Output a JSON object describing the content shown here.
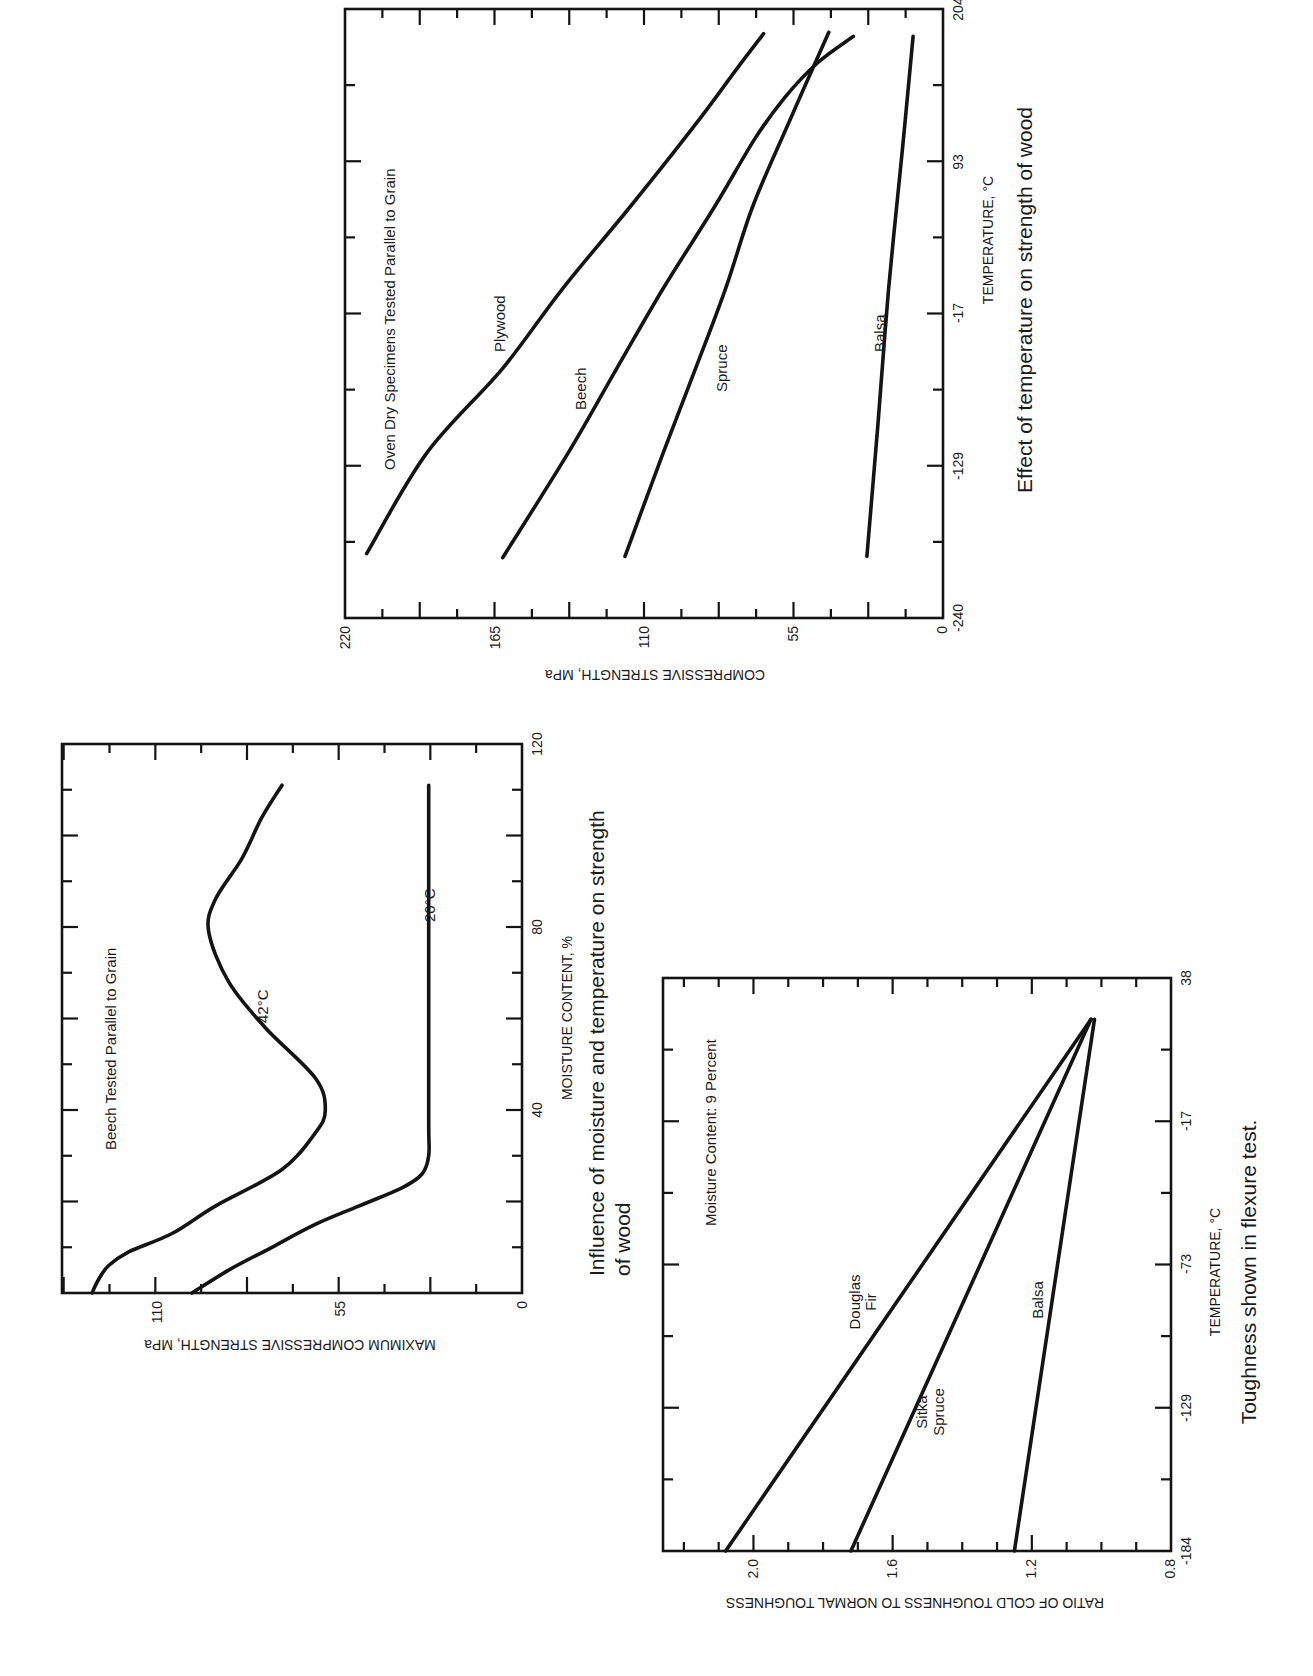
{
  "chart_data": [
    {
      "id": "temp_strength",
      "type": "line",
      "title": "Effect of temperature on strength of wood",
      "annotation": "Oven Dry Specimens Tested Parallel to Grain",
      "xlabel": "TEMPERATURE, °C",
      "ylabel": "COMPRESSIVE STRENGTH, MPa",
      "x_ticks": [
        "-240",
        "-129",
        "-17",
        "93",
        "204"
      ],
      "y_ticks": [
        "0",
        "55",
        "110",
        "165",
        "220"
      ],
      "xlim": [
        -240,
        204
      ],
      "ylim": [
        0,
        220
      ],
      "grid": false,
      "orientation": "rotated 90° counter-clockwise",
      "series": [
        {
          "name": "Plywood",
          "x": [
            -193,
            -120,
            -58,
            0,
            60,
            120,
            160,
            186
          ],
          "y": [
            212,
            190,
            162,
            140,
            115,
            91,
            76,
            66
          ]
        },
        {
          "name": "Beech",
          "x": [
            -196,
            -120,
            -58,
            0,
            60,
            110,
            140,
            165,
            184
          ],
          "y": [
            162,
            138,
            120,
            103,
            84,
            69,
            58,
            46,
            33
          ]
        },
        {
          "name": "Spruce",
          "x": [
            -195,
            -120,
            -58,
            0,
            60,
            120,
            187
          ],
          "y": [
            117,
            103,
            91,
            80,
            70,
            57,
            42
          ]
        },
        {
          "name": "Balsa",
          "x": [
            -195,
            -100,
            0,
            100,
            184
          ],
          "y": [
            28,
            24,
            20,
            15,
            11
          ]
        }
      ]
    },
    {
      "id": "moisture_temp_strength",
      "type": "line",
      "title": "Influence of moisture and temperature on strength of wood",
      "annotation": "Beech Tested Parallel to Grain",
      "xlabel": "MOISTURE CONTENT, %",
      "ylabel": "MAXIMUM COMPRESSIVE STRENGTH, MPa",
      "x_ticks": [
        "0",
        "40",
        "80",
        "120"
      ],
      "y_ticks": [
        "0",
        "55",
        "110"
      ],
      "xlim": [
        0,
        120
      ],
      "ylim": [
        0,
        138
      ],
      "grid": false,
      "orientation": "rotated 90° counter-clockwise",
      "series": [
        {
          "name": "-42°C",
          "x": [
            0,
            3,
            6,
            9,
            13,
            19,
            27,
            35,
            40,
            47,
            58,
            68,
            79,
            86,
            95,
            104,
            111
          ],
          "y": [
            129,
            127,
            124,
            118,
            105,
            92,
            72,
            62,
            59,
            62,
            77,
            88,
            94,
            92,
            84,
            78,
            72
          ]
        },
        {
          "name": "20°C",
          "x": [
            0,
            5,
            10,
            15,
            19,
            23,
            26,
            30,
            37,
            60,
            90,
            111
          ],
          "y": [
            99,
            88,
            75,
            62,
            49,
            36,
            30,
            28,
            28,
            28,
            28,
            28
          ]
        }
      ]
    },
    {
      "id": "toughness",
      "type": "line",
      "title": "Toughness shown in flexure test.",
      "annotation": "Moisture Content:  9 Percent",
      "xlabel": "TEMPERATURE, °C",
      "ylabel": "RATIO OF COLD TOUGHNESS TO NORMAL TOUGHNESS",
      "x_ticks": [
        "-184",
        "-129",
        "-73",
        "-17",
        "38"
      ],
      "y_ticks": [
        "0.8",
        "1.2",
        "1.6",
        "2.0"
      ],
      "xlim": [
        -184,
        38
      ],
      "ylim": [
        0.8,
        2.26
      ],
      "grid": false,
      "orientation": "rotated 90° counter-clockwise",
      "series": [
        {
          "name": "Douglas Fir",
          "x": [
            -184,
            22
          ],
          "y": [
            2.08,
            1.03
          ]
        },
        {
          "name": "Sitka Spruce",
          "x": [
            -184,
            22
          ],
          "y": [
            1.72,
            1.03
          ]
        },
        {
          "name": "Balsa",
          "x": [
            -184,
            22
          ],
          "y": [
            1.25,
            1.02
          ]
        }
      ]
    }
  ],
  "labels": {
    "c1": {
      "annotation": "Oven Dry Specimens Tested Parallel to Grain",
      "xlabel": "TEMPERATURE, °C",
      "ylabel": "COMPRESSIVE STRENGTH, MPa",
      "caption": "Effect of temperature on strength of wood",
      "series": [
        "Plywood",
        "Beech",
        "Spruce",
        "Balsa"
      ],
      "x_ticks": [
        "-240",
        "-129",
        "-17",
        "93",
        "204"
      ],
      "y_ticks": [
        "220",
        "165",
        "110",
        "55",
        "0"
      ]
    },
    "c2": {
      "annotation": "Beech Tested Parallel to Grain",
      "xlabel": "MOISTURE CONTENT, %",
      "ylabel": "MAXIMUM COMPRESSIVE STRENGTH, MPa",
      "caption_line1": "Influence of moisture and temperature on strength",
      "caption_line2": "of wood",
      "series": [
        "-42°C",
        "20°C"
      ],
      "x_ticks": [
        "0",
        "40",
        "80",
        "120"
      ],
      "y_ticks": [
        "110",
        "55",
        "0"
      ]
    },
    "c3": {
      "annotation": "Moisture Content:  9 Percent",
      "xlabel": "TEMPERATURE, °C",
      "ylabel": "RATIO OF COLD TOUGHNESS TO NORMAL TOUGHNESS",
      "caption": "Toughness shown in flexure test.",
      "series_line1": [
        "Douglas",
        "Sitka",
        "Balsa"
      ],
      "series_line2": [
        "Fir",
        "Spruce",
        ""
      ],
      "x_ticks": [
        "-184",
        "-129",
        "-73",
        "-17",
        "38"
      ],
      "y_ticks": [
        "2.0",
        "1.6",
        "1.2",
        "0.8"
      ]
    }
  }
}
